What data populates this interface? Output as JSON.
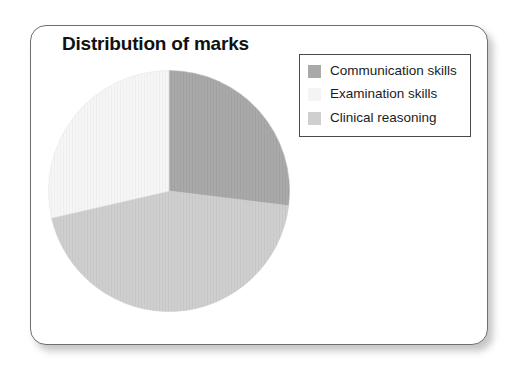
{
  "card": {
    "border_color": "#6f6f6f",
    "background": "#ffffff"
  },
  "chart_data": {
    "type": "pie",
    "title": "Distribution of marks",
    "xlabel": "",
    "ylabel": "",
    "legend_position": "top-right",
    "grid": false,
    "start_angle_deg": 0,
    "direction": "clockwise",
    "categories": [
      "Communication skills",
      "Examination skills",
      "Clinical reasoning"
    ],
    "values": [
      27,
      29,
      44
    ],
    "value_unit": "percent",
    "slices": [
      {
        "label": "Communication skills",
        "value": 27,
        "start_angle_deg": 0,
        "end_angle_deg": 97,
        "color": "#a9a9a9"
      },
      {
        "label": "Clinical reasoning",
        "value": 44,
        "start_angle_deg": 97,
        "end_angle_deg": 257,
        "color": "#cfcfcf"
      },
      {
        "label": "Examination skills",
        "value": 29,
        "start_angle_deg": 257,
        "end_angle_deg": 360,
        "color": "#f4f4f4"
      }
    ]
  },
  "legend": {
    "items": [
      {
        "label": "Communication skills",
        "color": "#a9a9a9"
      },
      {
        "label": "Examination skills",
        "color": "#f4f4f4"
      },
      {
        "label": "Clinical reasoning",
        "color": "#cfcfcf"
      }
    ]
  }
}
